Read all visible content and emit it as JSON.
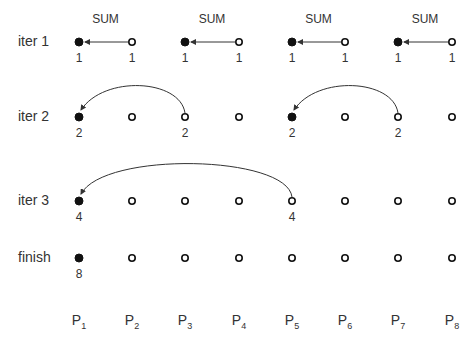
{
  "diagram": {
    "columns_x": [
      79,
      132,
      185,
      239,
      292,
      345,
      398,
      452
    ],
    "processors": [
      {
        "label": "P",
        "sub": "1"
      },
      {
        "label": "P",
        "sub": "2"
      },
      {
        "label": "P",
        "sub": "3"
      },
      {
        "label": "P",
        "sub": "4"
      },
      {
        "label": "P",
        "sub": "5"
      },
      {
        "label": "P",
        "sub": "6"
      },
      {
        "label": "P",
        "sub": "7"
      },
      {
        "label": "P",
        "sub": "8"
      }
    ],
    "sum_label": "SUM",
    "rows": [
      {
        "label": "iter 1",
        "y": 42,
        "filled": [
          0,
          2,
          4,
          6
        ],
        "values": [
          {
            "col": 0,
            "v": "1"
          },
          {
            "col": 1,
            "v": "1"
          },
          {
            "col": 2,
            "v": "1"
          },
          {
            "col": 3,
            "v": "1"
          },
          {
            "col": 4,
            "v": "1"
          },
          {
            "col": 5,
            "v": "1"
          },
          {
            "col": 6,
            "v": "1"
          },
          {
            "col": 7,
            "v": "1"
          }
        ],
        "arrows": [
          [
            1,
            0
          ],
          [
            3,
            2
          ],
          [
            5,
            4
          ],
          [
            7,
            6
          ]
        ]
      },
      {
        "label": "iter 2",
        "y": 117,
        "filled": [
          0,
          4
        ],
        "values": [
          {
            "col": 0,
            "v": "2"
          },
          {
            "col": 2,
            "v": "2"
          },
          {
            "col": 4,
            "v": "2"
          },
          {
            "col": 6,
            "v": "2"
          }
        ],
        "arrows": [
          [
            2,
            0
          ],
          [
            6,
            4
          ]
        ]
      },
      {
        "label": "iter 3",
        "y": 201,
        "filled": [
          0
        ],
        "values": [
          {
            "col": 0,
            "v": "4"
          },
          {
            "col": 4,
            "v": "4"
          }
        ],
        "arrows": [
          [
            4,
            0
          ]
        ]
      },
      {
        "label": "finish",
        "y": 258,
        "filled": [
          0
        ],
        "values": [
          {
            "col": 0,
            "v": "8"
          }
        ],
        "arrows": []
      }
    ]
  }
}
